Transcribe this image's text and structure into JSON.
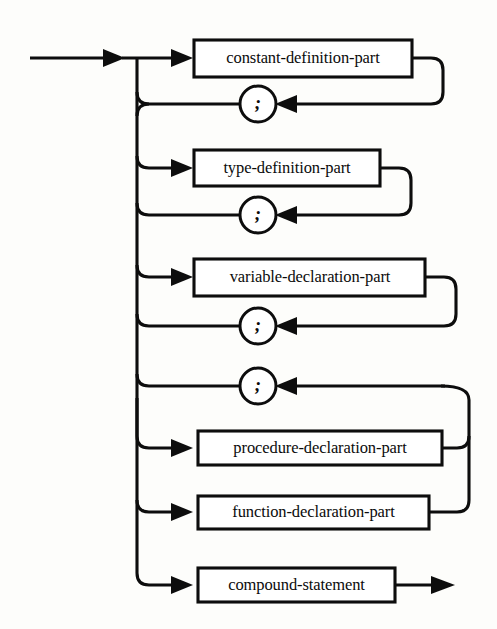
{
  "diagram": {
    "kind": "railroad-syntax-diagram",
    "background_color": "#fdfdfb",
    "line_color": "#0d0d0d",
    "box_fill": "#ffffff",
    "entry": {
      "name": "entry-arrow",
      "label": ""
    },
    "exit": {
      "name": "exit-arrow",
      "label": ""
    },
    "nonterminals": [
      {
        "id": "constant-definition-part",
        "label": "constant-definition-part",
        "row": 1
      },
      {
        "id": "type-definition-part",
        "label": "type-definition-part",
        "row": 3
      },
      {
        "id": "variable-declaration-part",
        "label": "variable-declaration-part",
        "row": 5
      },
      {
        "id": "procedure-declaration-part",
        "label": "procedure-declaration-part",
        "row": 8
      },
      {
        "id": "function-declaration-part",
        "label": "function-declaration-part",
        "row": 9
      },
      {
        "id": "compound-statement",
        "label": "compound-statement",
        "row": 10
      }
    ],
    "terminals": [
      {
        "id": "semicolon-1",
        "label": ";",
        "row": 2,
        "follows": "constant-definition-part"
      },
      {
        "id": "semicolon-2",
        "label": ";",
        "row": 4,
        "follows": "type-definition-part"
      },
      {
        "id": "semicolon-3",
        "label": ";",
        "row": 6,
        "follows": "variable-declaration-part"
      },
      {
        "id": "semicolon-4",
        "label": ";",
        "row": 7,
        "follows": "procedure-declaration-part, function-declaration-part"
      }
    ],
    "boxes_geometry": [
      {
        "id": "constant-definition-part",
        "x": 194,
        "y": 40,
        "w": 218,
        "h": 37,
        "loop_right_x": 443,
        "loop_to_y": 104
      },
      {
        "id": "type-definition-part",
        "x": 194,
        "y": 150,
        "w": 186,
        "h": 36,
        "loop_right_x": 411,
        "loop_to_y": 215
      },
      {
        "id": "variable-declaration-part",
        "x": 194,
        "y": 259,
        "w": 231,
        "h": 37,
        "loop_right_x": 456,
        "loop_to_y": 326
      },
      {
        "id": "procedure-declaration-part",
        "x": 198,
        "y": 431,
        "w": 244,
        "h": 34,
        "loop_right_x": 469,
        "loop_to_y": 386
      },
      {
        "id": "function-declaration-part",
        "x": 198,
        "y": 496,
        "w": 231,
        "h": 33,
        "loop_right_x": 469,
        "loop_to_y": 386
      },
      {
        "id": "compound-statement",
        "x": 198,
        "y": 568,
        "w": 197,
        "h": 34,
        "loop_right_x": 0,
        "loop_to_y": 0
      }
    ],
    "circles_geometry": [
      {
        "id": "semicolon-1",
        "cx": 258,
        "cy": 104,
        "r": 18
      },
      {
        "id": "semicolon-2",
        "cx": 258,
        "cy": 215,
        "r": 18
      },
      {
        "id": "semicolon-3",
        "cx": 258,
        "cy": 326,
        "r": 18
      },
      {
        "id": "semicolon-4",
        "cx": 258,
        "cy": 386,
        "r": 18
      }
    ],
    "trunk": {
      "x": 137,
      "top_y": 58,
      "bottom_y": 585
    },
    "branch_rows_y": [
      58,
      104,
      168,
      215,
      277,
      326,
      386,
      448,
      512,
      585
    ]
  }
}
